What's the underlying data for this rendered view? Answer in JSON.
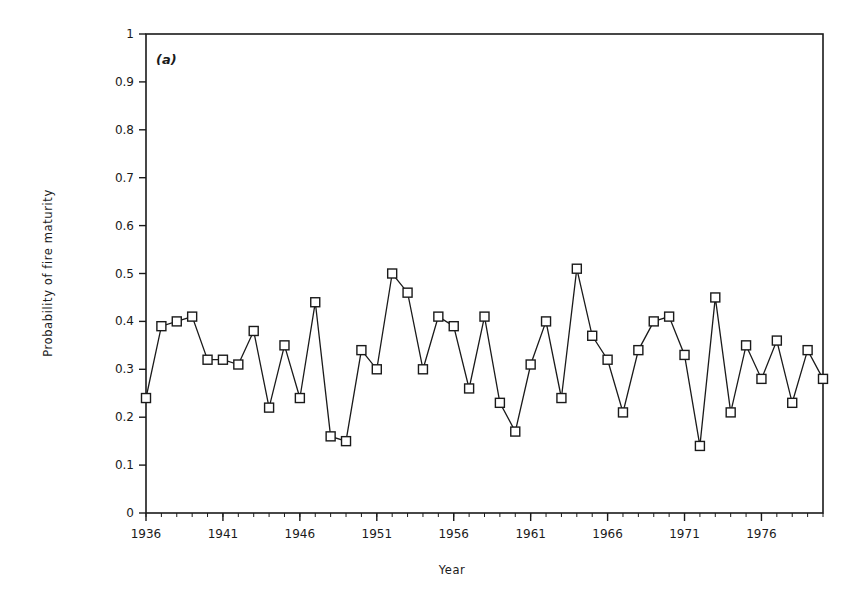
{
  "chart_data": {
    "type": "line",
    "panel_label": "(a)",
    "title": "",
    "xlabel": "Year",
    "ylabel": "Probability of fire maturity",
    "xlim": [
      1936,
      1980
    ],
    "ylim": [
      0,
      1
    ],
    "x_ticks": [
      1936,
      1941,
      1946,
      1951,
      1956,
      1961,
      1966,
      1971,
      1976
    ],
    "x_tick_labels": [
      "1936",
      "1941",
      "1946",
      "1951",
      "1956",
      "1961",
      "1966",
      "1971",
      "1976"
    ],
    "y_ticks": [
      0,
      0.1,
      0.2,
      0.3,
      0.4,
      0.5,
      0.6,
      0.7,
      0.8,
      0.9,
      1
    ],
    "y_tick_labels": [
      "0",
      "0.1",
      "0.2",
      "0.3",
      "0.4",
      "0.5",
      "0.6",
      "0.7",
      "0.8",
      "0.9",
      "1"
    ],
    "grid": false,
    "legend": null,
    "marker": "open-square",
    "x": [
      1936,
      1937,
      1938,
      1939,
      1940,
      1941,
      1942,
      1943,
      1944,
      1945,
      1946,
      1947,
      1948,
      1949,
      1950,
      1951,
      1952,
      1953,
      1954,
      1955,
      1956,
      1957,
      1958,
      1959,
      1960,
      1961,
      1962,
      1963,
      1964,
      1965,
      1966,
      1967,
      1968,
      1969,
      1970,
      1971,
      1972,
      1973,
      1974,
      1975,
      1976,
      1977,
      1978,
      1979,
      1980
    ],
    "series": [
      {
        "name": "Probability of fire maturity",
        "values": [
          0.24,
          0.39,
          0.4,
          0.41,
          0.32,
          0.32,
          0.31,
          0.38,
          0.22,
          0.35,
          0.24,
          0.44,
          0.16,
          0.15,
          0.34,
          0.3,
          0.5,
          0.46,
          0.3,
          0.41,
          0.39,
          0.26,
          0.41,
          0.23,
          0.17,
          0.31,
          0.4,
          0.24,
          0.51,
          0.37,
          0.32,
          0.21,
          0.34,
          0.4,
          0.41,
          0.33,
          0.14,
          0.45,
          0.21,
          0.35,
          0.28,
          0.36,
          0.23,
          0.34,
          0.28
        ]
      }
    ]
  },
  "style": {
    "line_color": "#1a1a1a",
    "background": "#ffffff"
  }
}
